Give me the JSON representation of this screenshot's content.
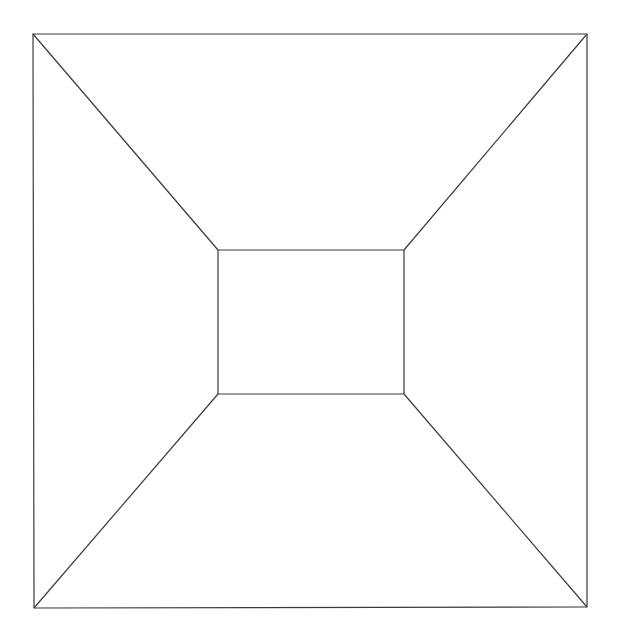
{
  "diagram": {
    "stroke_color": "#3a3a3a",
    "background": "#ffffff",
    "outer_rect": {
      "top_left": [
        33,
        34
      ],
      "top_right": [
        587,
        34
      ],
      "bottom_right": [
        587,
        607
      ],
      "bottom_left": [
        34,
        608
      ]
    },
    "inner_rect": {
      "top_left": [
        218,
        250
      ],
      "top_right": [
        404,
        250
      ],
      "bottom_right": [
        404,
        394
      ],
      "bottom_left": [
        218,
        394
      ]
    }
  }
}
